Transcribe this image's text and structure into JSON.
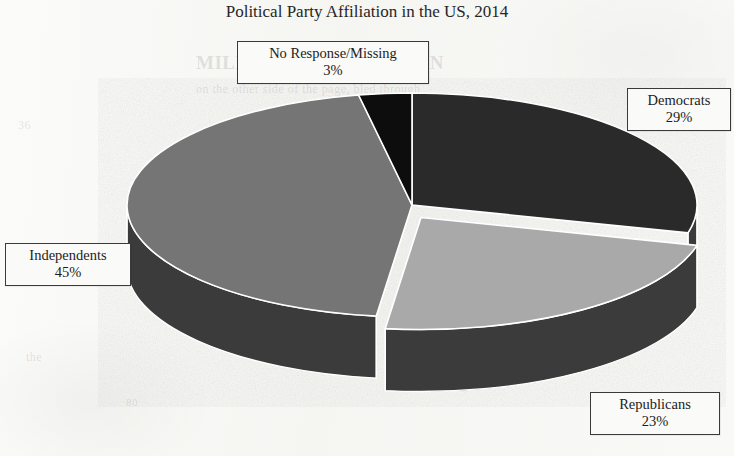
{
  "chart_data": {
    "type": "pie",
    "title": "Political Party Affiliation in the US, 2014",
    "xlabel": "",
    "ylabel": "",
    "legend_position": "none",
    "grid": false,
    "style": "3d-exploded-pie",
    "categories": [
      "Democrats",
      "Republicans",
      "Independents",
      "No Response/Missing"
    ],
    "values": [
      29,
      23,
      45,
      3
    ],
    "units": "percent",
    "total": 100,
    "colors": [
      "#2b2b2b",
      "#a9a9a9",
      "#757575",
      "#0b0b0b"
    ],
    "slices": [
      {
        "label": "Democrats",
        "percent": 29,
        "value_text": "29%",
        "color": "#2b2b2b",
        "exploded": false
      },
      {
        "label": "Republicans",
        "percent": 23,
        "value_text": "23%",
        "color": "#a9a9a9",
        "exploded": true
      },
      {
        "label": "Independents",
        "percent": 45,
        "value_text": "45%",
        "color": "#757575",
        "exploded": false
      },
      {
        "label": "No Response/Missing",
        "percent": 3,
        "value_text": "3%",
        "color": "#0b0b0b",
        "exploded": false
      }
    ]
  },
  "title": "Political Party Affiliation in the US, 2014",
  "callouts": {
    "no_response": {
      "label": "No Response/Missing",
      "percent": "3%"
    },
    "democrats": {
      "label": "Democrats",
      "percent": "29%"
    },
    "independents": {
      "label": "Independents",
      "percent": "45%"
    },
    "republicans": {
      "label": "Republicans",
      "percent": "23%"
    }
  },
  "background_artifacts": {
    "heading": "MILES AND INSTITUTION",
    "line_1": "on the other side of the page, bled through",
    "left_mark": "36",
    "bottom_mark": "the",
    "bottom_number": "80"
  },
  "colors": {
    "page_background": "#f8f8f6",
    "title_text": "#262626",
    "callout_border": "#3a3a3a",
    "callout_background": "#fafaf8",
    "slice_democrats": "#2b2b2b",
    "slice_republicans": "#a9a9a9",
    "slice_independents": "#757575",
    "slice_no_response": "#0b0b0b",
    "pie_side_wall": "#3a3a3a",
    "slice_divider": "#ffffff"
  }
}
